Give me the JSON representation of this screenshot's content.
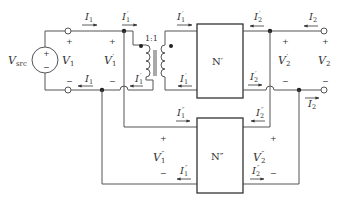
{
  "diagram": {
    "type": "circuit",
    "source": {
      "label": "V",
      "sub": "src"
    },
    "ports": {
      "V1": {
        "label": "V",
        "sub": "1"
      },
      "V1p": {
        "label": "V",
        "sub": "1",
        "prime": "′"
      },
      "V2p": {
        "label": "V",
        "sub": "2",
        "prime": "′"
      },
      "V2": {
        "label": "V",
        "sub": "2"
      },
      "V1pp": {
        "label": "V",
        "sub": "1",
        "prime": "″"
      },
      "V2pp": {
        "label": "V",
        "sub": "2",
        "prime": "″"
      }
    },
    "currents": {
      "I1": {
        "label": "I",
        "sub": "1"
      },
      "I1p": {
        "label": "I",
        "sub": "1",
        "prime": "′"
      },
      "I2p": {
        "label": "I",
        "sub": "2",
        "prime": "′"
      },
      "I2": {
        "label": "I",
        "sub": "2"
      },
      "I1pp": {
        "label": "I",
        "sub": "1",
        "prime": "″"
      },
      "I2pp": {
        "label": "I",
        "sub": "2",
        "prime": "″"
      }
    },
    "transformer": {
      "ratio": "1:1"
    },
    "networks": {
      "upper": "N′",
      "lower": "N″"
    },
    "signs": {
      "plus": "+",
      "minus": "−"
    }
  }
}
